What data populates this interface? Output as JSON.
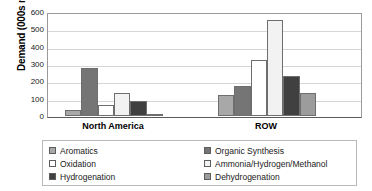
{
  "chart_data": {
    "type": "bar",
    "title": "",
    "xlabel": "",
    "ylabel": "Demand (000s mt)",
    "categories": [
      "North America",
      "ROW"
    ],
    "ylim": [
      0,
      600
    ],
    "yticks": [
      0,
      100,
      200,
      300,
      400,
      500,
      600
    ],
    "grid": true,
    "legend_position": "bottom",
    "series": [
      {
        "name": "Aromatics",
        "color": "#a8a8a8",
        "values": [
          35,
          122
        ]
      },
      {
        "name": "Organic Synthesis",
        "color": "#757575",
        "values": [
          275,
          172
        ]
      },
      {
        "name": "Oxidation",
        "color": "#ffffff",
        "values": [
          62,
          322
        ]
      },
      {
        "name": "Ammonia/Hydrogen/Methanol",
        "color": "#f2f2f2",
        "values": [
          135,
          555
        ]
      },
      {
        "name": "Hydrogenation",
        "color": "#404040",
        "values": [
          88,
          232
        ]
      },
      {
        "name": "Dehydrogenation",
        "color": "#9c9c9c",
        "values": [
          5,
          135
        ]
      }
    ]
  },
  "axis": {
    "y_title": "Demand (000s mt)",
    "y_tick_labels": [
      "600",
      "500",
      "400",
      "300",
      "200",
      "100",
      "0"
    ]
  },
  "categories": [
    {
      "label": "North America"
    },
    {
      "label": "ROW"
    }
  ],
  "legend": {
    "items": [
      {
        "label": "Aromatics"
      },
      {
        "label": "Organic Synthesis"
      },
      {
        "label": "Oxidation"
      },
      {
        "label": "Ammonia/Hydrogen/Methanol"
      },
      {
        "label": "Hydrogenation"
      },
      {
        "label": "Dehydrogenation"
      }
    ]
  }
}
